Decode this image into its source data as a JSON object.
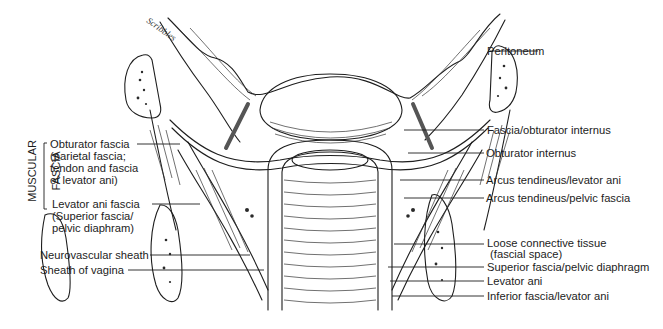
{
  "figure": {
    "type": "anatomical-illustration",
    "signature": "Scribbled signature (artist)"
  },
  "left_group": {
    "title_line1": "MUSCULAR",
    "title_line2": "FASCIA",
    "labels": [
      {
        "id": "obturator-fascia",
        "text": "Obturator fascia\n(parietal fascia;\ntendon and fascia\nof levator ani)"
      },
      {
        "id": "levator-ani-fascia",
        "text": "Levator ani fascia\n(Superior fascia/\npelvic diaphram)"
      }
    ]
  },
  "left_labels": [
    {
      "id": "neurovascular-sheath",
      "text": "Neurovascular sheath"
    },
    {
      "id": "sheath-of-vagina",
      "text": "Sheath of vagina"
    }
  ],
  "right_labels": [
    {
      "id": "peritoneum",
      "text": "Peritoneum"
    },
    {
      "id": "fascia-obturator-internus",
      "text": "Fascia/obturator internus"
    },
    {
      "id": "obturator-internus",
      "text": "Obturator internus"
    },
    {
      "id": "arcus-tendineus-levator-ani",
      "text": "Arcus tendineus/levator ani"
    },
    {
      "id": "arcus-tendineus-pelvic-fascia",
      "text": "Arcus tendineus/pelvic fascia"
    },
    {
      "id": "loose-connective-tissue",
      "text": "Loose connective tissue\n (fascial space)"
    },
    {
      "id": "superior-fascia-pelvic-diaphragm",
      "text": "Superior fascia/pelvic diaphragm"
    },
    {
      "id": "levator-ani",
      "text": "Levator ani"
    },
    {
      "id": "inferior-fascia-levator-ani",
      "text": "Inferior fascia/levator ani"
    }
  ]
}
